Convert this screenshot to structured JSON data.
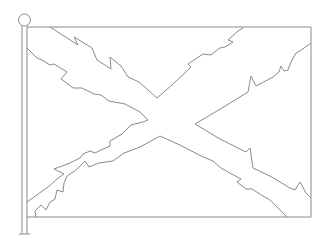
{
  "figure": {
    "colors": {
      "background": "#ffffff",
      "stroke": "#8a8a8a"
    },
    "flag": {
      "left": 27,
      "top": 27,
      "right": 311,
      "bottom": 217
    },
    "pole": {
      "x1": 22,
      "x2": 27,
      "top": 26,
      "bottom": 234,
      "finial_cx": 24,
      "finial_cy": 20,
      "finial_r": 6
    }
  }
}
